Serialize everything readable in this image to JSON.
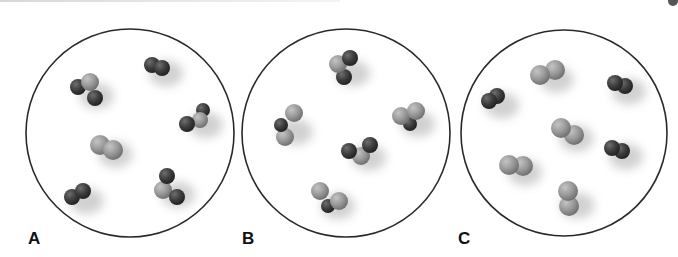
{
  "figure": {
    "colors": {
      "background": "#ffffff",
      "outline": "#2a2a2a",
      "dark_atom": "#3d3d3d",
      "light_atom": "#9a9a9a",
      "label": "#111111"
    },
    "panels": [
      {
        "label": "A",
        "circle": {
          "cx": 130,
          "cy": 133,
          "r": 104
        },
        "label_pos": {
          "x": 28,
          "y": 230
        },
        "molecules": [
          {
            "type": "dark-light-dark",
            "atoms": [
              {
                "x": 78,
                "y": 87,
                "r": 8,
                "shade": "dark"
              },
              {
                "x": 90,
                "y": 82,
                "r": 9,
                "shade": "light"
              },
              {
                "x": 95,
                "y": 98,
                "r": 8,
                "shade": "dark"
              }
            ]
          },
          {
            "type": "dark-diatomic",
            "atoms": [
              {
                "x": 152,
                "y": 65,
                "r": 8,
                "shade": "dark"
              },
              {
                "x": 162,
                "y": 68,
                "r": 8,
                "shade": "dark"
              }
            ]
          },
          {
            "type": "dark-light-dark",
            "atoms": [
              {
                "x": 203,
                "y": 110,
                "r": 7,
                "shade": "dark"
              },
              {
                "x": 200,
                "y": 120,
                "r": 8,
                "shade": "light"
              },
              {
                "x": 187,
                "y": 124,
                "r": 8,
                "shade": "dark"
              }
            ]
          },
          {
            "type": "light-diatomic",
            "atoms": [
              {
                "x": 100,
                "y": 145,
                "r": 10,
                "shade": "light"
              },
              {
                "x": 113,
                "y": 150,
                "r": 10,
                "shade": "light"
              }
            ]
          },
          {
            "type": "dark-diatomic",
            "atoms": [
              {
                "x": 72,
                "y": 197,
                "r": 8,
                "shade": "dark"
              },
              {
                "x": 83,
                "y": 191,
                "r": 8,
                "shade": "dark"
              }
            ]
          },
          {
            "type": "dark-light-dark",
            "atoms": [
              {
                "x": 163,
                "y": 190,
                "r": 9,
                "shade": "light"
              },
              {
                "x": 167,
                "y": 176,
                "r": 8,
                "shade": "dark"
              },
              {
                "x": 177,
                "y": 197,
                "r": 8,
                "shade": "dark"
              }
            ]
          }
        ]
      },
      {
        "label": "B",
        "circle": {
          "cx": 346,
          "cy": 133,
          "r": 104
        },
        "label_pos": {
          "x": 242,
          "y": 230
        },
        "molecules": [
          {
            "type": "light-dark-dark",
            "atoms": [
              {
                "x": 344,
                "y": 77,
                "r": 8,
                "shade": "dark"
              },
              {
                "x": 338,
                "y": 64,
                "r": 9,
                "shade": "light"
              },
              {
                "x": 350,
                "y": 58,
                "r": 8,
                "shade": "dark"
              }
            ]
          },
          {
            "type": "light-dark-light",
            "atoms": [
              {
                "x": 294,
                "y": 113,
                "r": 9,
                "shade": "light"
              },
              {
                "x": 285,
                "y": 137,
                "r": 9,
                "shade": "light"
              },
              {
                "x": 281,
                "y": 125,
                "r": 7,
                "shade": "dark"
              }
            ]
          },
          {
            "type": "light-light-dark",
            "atoms": [
              {
                "x": 410,
                "y": 124,
                "r": 7,
                "shade": "dark"
              },
              {
                "x": 401,
                "y": 116,
                "r": 9,
                "shade": "light"
              },
              {
                "x": 416,
                "y": 111,
                "r": 9,
                "shade": "light"
              }
            ]
          },
          {
            "type": "dark-light-dark",
            "atoms": [
              {
                "x": 361,
                "y": 156,
                "r": 9,
                "shade": "light"
              },
              {
                "x": 349,
                "y": 151,
                "r": 8,
                "shade": "dark"
              },
              {
                "x": 370,
                "y": 145,
                "r": 8,
                "shade": "dark"
              }
            ]
          },
          {
            "type": "light-dark-light",
            "atoms": [
              {
                "x": 328,
                "y": 206,
                "r": 7,
                "shade": "dark"
              },
              {
                "x": 339,
                "y": 201,
                "r": 9,
                "shade": "light"
              },
              {
                "x": 320,
                "y": 191,
                "r": 9,
                "shade": "light"
              }
            ]
          }
        ]
      },
      {
        "label": "C",
        "circle": {
          "cx": 564,
          "cy": 133,
          "r": 103
        },
        "label_pos": {
          "x": 458,
          "y": 230
        },
        "molecules": [
          {
            "type": "light-diatomic",
            "atoms": [
              {
                "x": 555,
                "y": 70,
                "r": 10,
                "shade": "light"
              },
              {
                "x": 540,
                "y": 75,
                "r": 10,
                "shade": "light"
              }
            ]
          },
          {
            "type": "dark-diatomic",
            "atoms": [
              {
                "x": 497,
                "y": 96,
                "r": 8,
                "shade": "dark"
              },
              {
                "x": 489,
                "y": 101,
                "r": 8,
                "shade": "dark"
              }
            ]
          },
          {
            "type": "dark-diatomic",
            "atoms": [
              {
                "x": 625,
                "y": 86,
                "r": 8,
                "shade": "dark"
              },
              {
                "x": 615,
                "y": 83,
                "r": 8,
                "shade": "dark"
              }
            ]
          },
          {
            "type": "light-diatomic",
            "atoms": [
              {
                "x": 574,
                "y": 135,
                "r": 10,
                "shade": "light"
              },
              {
                "x": 561,
                "y": 128,
                "r": 10,
                "shade": "light"
              }
            ]
          },
          {
            "type": "dark-diatomic",
            "atoms": [
              {
                "x": 622,
                "y": 151,
                "r": 8,
                "shade": "dark"
              },
              {
                "x": 612,
                "y": 148,
                "r": 8,
                "shade": "dark"
              }
            ]
          },
          {
            "type": "light-diatomic",
            "atoms": [
              {
                "x": 523,
                "y": 166,
                "r": 10,
                "shade": "light"
              },
              {
                "x": 509,
                "y": 165,
                "r": 10,
                "shade": "light"
              }
            ]
          },
          {
            "type": "light-diatomic",
            "atoms": [
              {
                "x": 569,
                "y": 206,
                "r": 10,
                "shade": "light"
              },
              {
                "x": 568,
                "y": 191,
                "r": 10,
                "shade": "light"
              }
            ]
          }
        ]
      }
    ]
  }
}
